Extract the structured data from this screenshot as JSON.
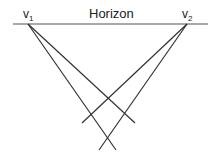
{
  "title": "Horizon",
  "vanishing_points": [
    {
      "label": "v",
      "sub": "1",
      "x": 28,
      "y": 24
    },
    {
      "label": "v",
      "sub": "2",
      "x": 187,
      "y": 24
    }
  ],
  "horizon": {
    "x1": 13,
    "y1": 24,
    "x2": 208,
    "y2": 24
  },
  "lines": [
    {
      "from": "v1",
      "x1": 28,
      "y1": 24,
      "x2": 135,
      "y2": 123
    },
    {
      "from": "v1",
      "x1": 28,
      "y1": 24,
      "x2": 116,
      "y2": 150
    },
    {
      "from": "v2",
      "x1": 187,
      "y1": 24,
      "x2": 82,
      "y2": 123
    },
    {
      "from": "v2",
      "x1": 187,
      "y1": 24,
      "x2": 99,
      "y2": 150
    }
  ],
  "colors": {
    "line": "#333333",
    "horizon": "#555555"
  }
}
